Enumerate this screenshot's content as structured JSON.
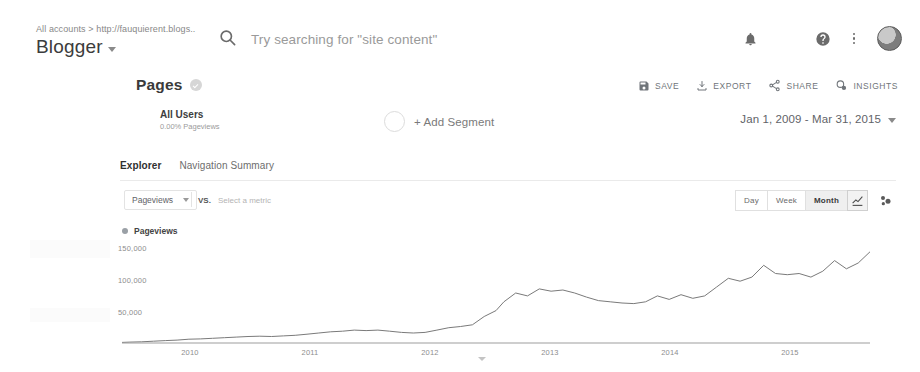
{
  "header": {
    "breadcrumb": "All accounts > http://fauquierent.blogs..",
    "property_name": "Blogger",
    "search_placeholder": "Try searching for \"site content\"",
    "icons": {
      "search": "search-icon",
      "notifications": "bell-icon",
      "apps": "grid-icon",
      "help": "help-icon",
      "more": "more-vert-icon",
      "account": "avatar"
    }
  },
  "report": {
    "title": "Pages",
    "actions": [
      {
        "label": "SAVE",
        "icon": "save-icon"
      },
      {
        "label": "EXPORT",
        "icon": "export-icon"
      },
      {
        "label": "SHARE",
        "icon": "share-icon"
      },
      {
        "label": "INSIGHTS",
        "icon": "insights-icon"
      }
    ]
  },
  "segment": {
    "name": "All Users",
    "subtitle": "0.00% Pageviews",
    "add_label": "+ Add Segment",
    "date_range": "Jan 1, 2009 - Mar 31, 2015"
  },
  "tabs": [
    {
      "label": "Explorer",
      "active": true
    },
    {
      "label": "Navigation Summary",
      "active": false
    }
  ],
  "controls": {
    "metric": "Pageviews",
    "vs_label": "VS.",
    "compare_placeholder": "Select a metric",
    "granularity": [
      {
        "label": "Day",
        "active": false
      },
      {
        "label": "Week",
        "active": false
      },
      {
        "label": "Month",
        "active": true
      }
    ],
    "chart_type_icon": "line-chart-icon",
    "motion_icon": "motion-chart-icon"
  },
  "chart_data": {
    "type": "line",
    "title": "Pageviews",
    "xlabel": "",
    "ylabel": "Pageviews",
    "legend": [
      "Pageviews"
    ],
    "legend_position": "top-left",
    "grid": false,
    "ylim": [
      0,
      175000
    ],
    "yticks": [
      50000,
      100000,
      150000
    ],
    "ytick_labels": [
      "50,000",
      "100,000",
      "150,000"
    ],
    "xticks": [
      "2010",
      "2011",
      "2012",
      "2013",
      "2014",
      "2015"
    ],
    "x": [
      "2009-01",
      "2009-04",
      "2009-07",
      "2009-10",
      "2010-01",
      "2010-04",
      "2010-07",
      "2010-10",
      "2011-01",
      "2011-04",
      "2011-07",
      "2011-10",
      "2012-01",
      "2012-03",
      "2012-05",
      "2012-07",
      "2012-09",
      "2012-11",
      "2013-01",
      "2013-03",
      "2013-05",
      "2013-07",
      "2013-09",
      "2013-11",
      "2014-01",
      "2014-03",
      "2014-05",
      "2014-07",
      "2014-09",
      "2014-11",
      "2015-01",
      "2015-03"
    ],
    "values": [
      1000,
      1500,
      2000,
      2500,
      3000,
      4000,
      5000,
      6000,
      7000,
      9000,
      11000,
      12000,
      14000,
      19000,
      22000,
      20000,
      23000,
      22000,
      20000,
      12000,
      13000,
      34000,
      38000,
      34000,
      37000,
      36000,
      33000,
      31000,
      30000,
      30000,
      31000,
      34000
    ],
    "series": [
      {
        "name": "Pageviews",
        "points": [
          [
            0,
            1000
          ],
          [
            2,
            1500
          ],
          [
            5,
            2000
          ],
          [
            8,
            3000
          ],
          [
            11,
            4000
          ],
          [
            14,
            5000
          ],
          [
            17,
            6500
          ],
          [
            20,
            7000
          ],
          [
            23,
            8000
          ],
          [
            26,
            9000
          ],
          [
            29,
            10000
          ],
          [
            32,
            11000
          ],
          [
            35,
            11500
          ],
          [
            38,
            11000
          ],
          [
            41,
            12000
          ],
          [
            44,
            13000
          ],
          [
            47,
            15000
          ],
          [
            50,
            17000
          ],
          [
            53,
            19000
          ],
          [
            56,
            20000
          ],
          [
            59,
            22000
          ],
          [
            62,
            21000
          ],
          [
            65,
            22000
          ],
          [
            68,
            20000
          ],
          [
            71,
            18000
          ],
          [
            74,
            17000
          ],
          [
            77,
            18000
          ],
          [
            80,
            22000
          ],
          [
            83,
            26000
          ],
          [
            86,
            28000
          ],
          [
            89,
            31000
          ],
          [
            92,
            45000
          ],
          [
            95,
            55000
          ],
          [
            97,
            70000
          ],
          [
            100,
            85000
          ],
          [
            103,
            80000
          ],
          [
            106,
            92000
          ],
          [
            109,
            88000
          ],
          [
            112,
            90000
          ],
          [
            115,
            85000
          ],
          [
            118,
            78000
          ],
          [
            121,
            72000
          ],
          [
            124,
            70000
          ],
          [
            127,
            68000
          ],
          [
            130,
            67000
          ],
          [
            133,
            70000
          ],
          [
            136,
            80000
          ],
          [
            139,
            74000
          ],
          [
            142,
            82000
          ],
          [
            145,
            76000
          ],
          [
            148,
            80000
          ],
          [
            151,
            95000
          ],
          [
            154,
            110000
          ],
          [
            157,
            105000
          ],
          [
            160,
            112000
          ],
          [
            163,
            132000
          ],
          [
            166,
            118000
          ],
          [
            169,
            116000
          ],
          [
            172,
            118000
          ],
          [
            175,
            112000
          ],
          [
            178,
            122000
          ],
          [
            181,
            140000
          ],
          [
            184,
            126000
          ],
          [
            187,
            136000
          ],
          [
            190,
            155000
          ]
        ]
      }
    ],
    "line_color": "#7a7a7a",
    "baseline_color": "#9e9e9e",
    "peak_value": 155000,
    "start_value": 1000
  }
}
